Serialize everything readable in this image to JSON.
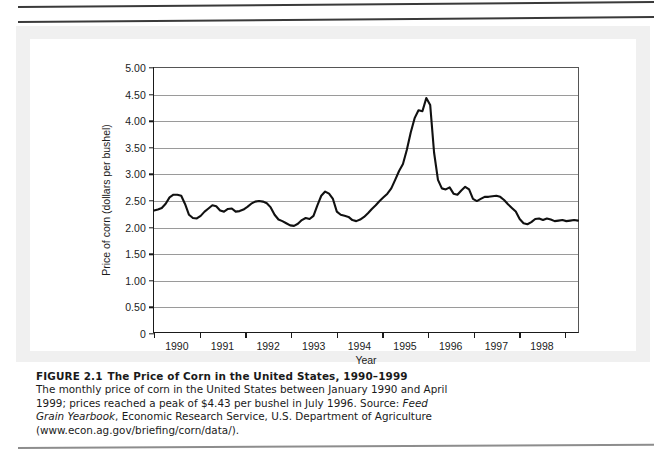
{
  "figure": {
    "number_label": "FIGURE 2.1",
    "title": "The Price of Corn in the United States, 1990–1999",
    "caption_part1": "The monthly price of corn in the United States between January 1990 and April 1999; prices reached a peak of $4.43 per bushel in July 1996. Source: ",
    "caption_source_italic": "Feed Grain Yearbook",
    "caption_part2": ", Economic Research Service, U.S. Department of Agriculture (www.econ.ag.gov/briefing/corn/data/)."
  },
  "chart_data": {
    "type": "line",
    "title": "",
    "xlabel": "Year",
    "ylabel": "Price of corn (dollars per bushel)",
    "ylim": [
      0,
      5.0
    ],
    "ytick_labels": [
      "0",
      "0.50",
      "1.00",
      "1.50",
      "2.00",
      "2.50",
      "3.00",
      "3.50",
      "4.00",
      "4.50",
      "5.00"
    ],
    "ytick_values": [
      0,
      0.5,
      1.0,
      1.5,
      2.0,
      2.5,
      3.0,
      3.5,
      4.0,
      4.5,
      5.0
    ],
    "grid": true,
    "legend": "none",
    "xtick_labels": [
      "1990",
      "1991",
      "1992",
      "1993",
      "1994",
      "1995",
      "1996",
      "1997",
      "1998"
    ],
    "x_range": [
      "1990-01",
      "1999-04"
    ],
    "line_color": "#111111",
    "series": [
      {
        "name": "Price of corn (dollars per bushel)",
        "units": "dollars per bushel",
        "values": [
          2.3,
          2.32,
          2.35,
          2.43,
          2.55,
          2.6,
          2.6,
          2.58,
          2.42,
          2.22,
          2.16,
          2.15,
          2.2,
          2.28,
          2.34,
          2.4,
          2.38,
          2.3,
          2.28,
          2.33,
          2.34,
          2.28,
          2.29,
          2.32,
          2.37,
          2.43,
          2.47,
          2.48,
          2.47,
          2.44,
          2.36,
          2.22,
          2.13,
          2.1,
          2.06,
          2.02,
          2.01,
          2.05,
          2.12,
          2.16,
          2.14,
          2.2,
          2.4,
          2.58,
          2.66,
          2.62,
          2.52,
          2.28,
          2.22,
          2.2,
          2.18,
          2.12,
          2.1,
          2.13,
          2.18,
          2.25,
          2.33,
          2.4,
          2.48,
          2.55,
          2.62,
          2.72,
          2.88,
          3.05,
          3.18,
          3.45,
          3.78,
          4.05,
          4.2,
          4.18,
          4.43,
          4.3,
          3.4,
          2.88,
          2.72,
          2.7,
          2.74,
          2.62,
          2.6,
          2.68,
          2.75,
          2.7,
          2.52,
          2.48,
          2.52,
          2.56,
          2.56,
          2.57,
          2.58,
          2.56,
          2.5,
          2.42,
          2.35,
          2.28,
          2.14,
          2.06,
          2.04,
          2.08,
          2.14,
          2.15,
          2.12,
          2.15,
          2.13,
          2.1,
          2.11,
          2.12,
          2.1,
          2.11,
          2.12,
          2.11
        ]
      }
    ],
    "annotations": {
      "peak_value": 4.43,
      "peak_label": "July 1996"
    }
  }
}
